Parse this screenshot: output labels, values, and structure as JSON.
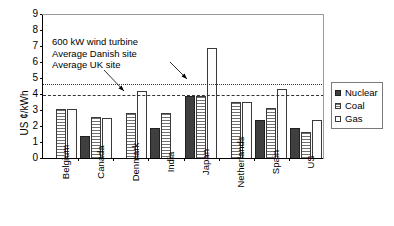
{
  "chart_data": {
    "type": "bar",
    "title": "",
    "xlabel": "",
    "ylabel": "US ¢/kWh",
    "ylim": [
      0,
      9
    ],
    "yticks": [
      0,
      1,
      2,
      3,
      4,
      5,
      6,
      7,
      8,
      9
    ],
    "grid": false,
    "legend_position": "right",
    "categories": [
      "Belgium",
      "Canada",
      "Denmark",
      "India",
      "Japan",
      "Netherlands",
      "Spain",
      "US"
    ],
    "series": [
      {
        "name": "Nuclear",
        "color": "#3f3f3f",
        "values": [
          null,
          1.35,
          null,
          1.85,
          3.9,
          null,
          2.4,
          1.9
        ]
      },
      {
        "name": "Coal",
        "color": "#6f6f6f",
        "values": [
          3.05,
          2.55,
          2.8,
          2.8,
          3.85,
          3.5,
          3.1,
          1.6
        ]
      },
      {
        "name": "Gas",
        "color": "#ffffff",
        "values": [
          3.05,
          2.5,
          4.2,
          null,
          6.85,
          3.5,
          4.3,
          2.4
        ]
      }
    ],
    "reference_lines": [
      {
        "name": "Average UK site",
        "value": 4.55,
        "style": "dotted"
      },
      {
        "name": "Average Danish site",
        "value": 3.9,
        "style": "dashed"
      }
    ],
    "annotation": {
      "line1": "600 kW wind turbine",
      "line2": "Average Danish site",
      "line3": "Average UK site"
    }
  },
  "legend": {
    "items": [
      {
        "label": "Nuclear"
      },
      {
        "label": "Coal"
      },
      {
        "label": "Gas"
      }
    ]
  }
}
